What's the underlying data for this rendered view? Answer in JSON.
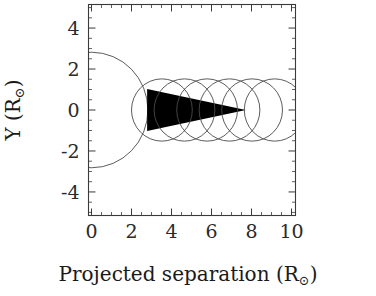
{
  "figure": {
    "width": 376,
    "height": 296,
    "background": "#ffffff",
    "ink_color": "#1a1a1a",
    "line_color": "#4a4a4a"
  },
  "chart_data": {
    "type": "scatter",
    "title": "",
    "xlabel": "Projected separation (R⊙)",
    "ylabel": "Y (R⊙)",
    "xlabel_main": "Projected separation (R",
    "xlabel_sub": "⊙",
    "xlabel_close": ")",
    "ylabel_main": "Y (R",
    "ylabel_sub": "⊙",
    "ylabel_close": ")",
    "xlim": [
      -0.15,
      10.2
    ],
    "ylim": [
      -5.15,
      5.15
    ],
    "grid": false,
    "legend": false,
    "x_ticks": [
      0,
      2,
      4,
      6,
      8,
      10
    ],
    "x_tick_labels": [
      "0",
      "2",
      "4",
      "6",
      "8",
      "10"
    ],
    "x_minor_interval": 0.5,
    "y_ticks": [
      4,
      2,
      0,
      -2,
      -4
    ],
    "y_tick_labels": [
      "4",
      "2",
      "0",
      "-2",
      "-4"
    ],
    "y_minor_interval": 0.5,
    "series": [
      {
        "name": "primary-star-disk",
        "shape": "circle",
        "cx": 0.0,
        "cy": 0.0,
        "r": 2.82,
        "filled": false
      },
      {
        "name": "companion-wind-circles",
        "shape": "circle",
        "r": 1.52,
        "filled": false,
        "centers_x": [
          3.52,
          4.65,
          5.78,
          6.9,
          8.03,
          9.16
        ],
        "center_y": 0.0
      },
      {
        "name": "shadow-cone",
        "shape": "wedge",
        "base_x": 2.78,
        "base_half_height": 1.02,
        "apex_x": 7.72,
        "apex_y": 0.0,
        "fill": "#000000"
      }
    ]
  }
}
